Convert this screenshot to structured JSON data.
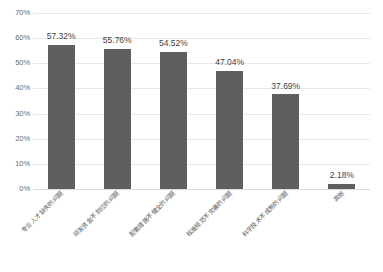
{
  "chart_data": {
    "type": "bar",
    "title": "",
    "subtitle": "",
    "xlabel": "",
    "ylabel": "",
    "ylim": [
      0,
      70
    ],
    "ytick_step": 10,
    "ytick_labels": [
      "0%",
      "10%",
      "20%",
      "30%",
      "40%",
      "50%",
      "60%",
      "70%"
    ],
    "ytick_values": [
      0,
      10,
      20,
      30,
      40,
      50,
      60,
      70
    ],
    "grid": true,
    "legend": false,
    "legend_position": "none",
    "bar_color": "#5f5f5f",
    "gridline_color": "#e8e8e8",
    "background_color": "#ffffff",
    "categories": [
      "专业人才缺失的问题",
      "研发资金不到位的问题",
      "配套措施不健全的问题",
      "标准规范不完善的问题",
      "科学技术不成熟的问题",
      "其他"
    ],
    "values": [
      57.32,
      55.76,
      54.52,
      47.04,
      37.69,
      2.18
    ],
    "data_labels": [
      "57.32%",
      "55.76%",
      "54.52%",
      "47.04%",
      "37.69%",
      "2.18%"
    ]
  }
}
